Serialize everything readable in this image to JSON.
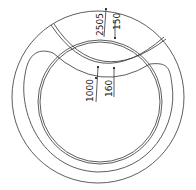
{
  "drawing": {
    "type": "circular track plan view",
    "line_color": "#333333",
    "background": "#ffffff",
    "dimensions": [
      {
        "id": "dim-2505",
        "label": "2505"
      },
      {
        "id": "dim-150",
        "label": "150"
      },
      {
        "id": "dim-1000",
        "label": "1000"
      },
      {
        "id": "dim-160",
        "label": "160"
      }
    ],
    "caption": ""
  }
}
